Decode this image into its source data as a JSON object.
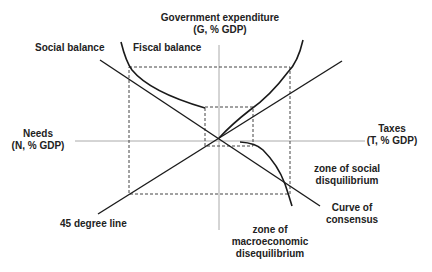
{
  "diagram": {
    "axes": {
      "vertical": {
        "line1": "Government expenditure",
        "line2": "(G, % GDP)"
      },
      "horizontal_right": {
        "line1": "Taxes",
        "line2": "(T, % GDP)"
      },
      "horizontal_left": {
        "line1": "Needs",
        "line2": "(N, % GDP)"
      }
    },
    "lines": {
      "social_balance": "Social balance",
      "fiscal_balance": "Fiscal balance",
      "forty_five": "45 degree line",
      "consensus_line1": "Curve of",
      "consensus_line2": "consensus"
    },
    "zones": {
      "social_line1": "zone of social",
      "social_line2": "disquilibrium",
      "macro_line1": "zone of",
      "macro_line2": "macroeconomic",
      "macro_line3": "disequilibrium"
    },
    "colors": {
      "line": "#1a1a1a",
      "axis": "#aaaaaa",
      "dash": "#444444"
    }
  }
}
